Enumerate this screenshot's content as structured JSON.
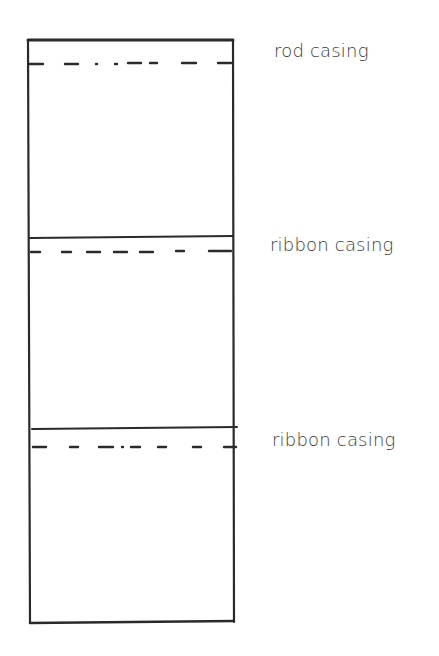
{
  "diagram": {
    "type": "sewing pattern panel / curtain casing layout",
    "stroke_color": "#2a2a2a",
    "panel": {
      "left": 28,
      "right": 233,
      "top": 40,
      "bottom": 623
    },
    "sections": [
      {
        "label": "rod casing",
        "line_y": 40,
        "dash_y": 63,
        "label_x": 274,
        "label_y": 56
      },
      {
        "label": "ribbon casing",
        "line_y": 238,
        "dash_y": 252,
        "label_x": 270,
        "label_y": 250
      },
      {
        "label": "ribbon casing",
        "line_y": 428,
        "dash_y": 447,
        "label_x": 272,
        "label_y": 444
      }
    ]
  },
  "labels": {
    "rod_casing": "rod casing",
    "ribbon_casing_1": "ribbon casing",
    "ribbon_casing_2": "ribbon casing"
  }
}
